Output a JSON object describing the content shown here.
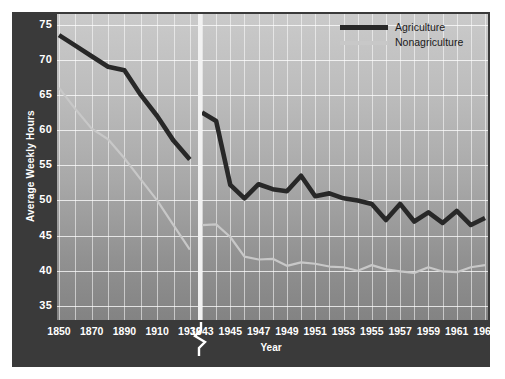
{
  "chart_data": {
    "type": "line",
    "title": "",
    "xlabel": "Year",
    "ylabel": "Average Weekly Hours",
    "ylim": [
      33,
      76.5
    ],
    "yticks": [
      35,
      40,
      45,
      50,
      55,
      60,
      65,
      70,
      75
    ],
    "grid": true,
    "axis_break": true,
    "legend_position": "top-right",
    "panels": [
      {
        "name": "historical",
        "xlim": [
          1850,
          1935
        ],
        "xticks": [
          1850,
          1870,
          1890,
          1910,
          1930
        ],
        "x": [
          1850,
          1860,
          1870,
          1880,
          1890,
          1900,
          1910,
          1920,
          1930
        ],
        "series": [
          {
            "name": "Agriculture",
            "color": "#282828",
            "values": [
              73.5,
              72.0,
              70.5,
              69.0,
              68.5,
              65.0,
              62.0,
              58.5,
              55.8
            ]
          },
          {
            "name": "Nonagriculture",
            "color": "#c8c8c8",
            "values": [
              66.0,
              63.0,
              60.2,
              58.7,
              56.0,
              53.0,
              50.0,
              46.5,
              43.0
            ]
          }
        ]
      },
      {
        "name": "modern",
        "xlim": [
          1943,
          1963
        ],
        "xticks": [
          1943,
          1945,
          1947,
          1949,
          1951,
          1953,
          1955,
          1957,
          1959,
          1961,
          1963
        ],
        "x": [
          1943,
          1944,
          1945,
          1946,
          1947,
          1948,
          1949,
          1950,
          1951,
          1952,
          1953,
          1954,
          1955,
          1956,
          1957,
          1958,
          1959,
          1960,
          1961,
          1962,
          1963
        ],
        "series": [
          {
            "name": "Agriculture",
            "color": "#282828",
            "values": [
              62.5,
              61.3,
              52.2,
              50.3,
              52.3,
              51.6,
              51.3,
              53.5,
              50.6,
              51.0,
              50.3,
              50.0,
              49.5,
              47.2,
              49.5,
              47.0,
              48.3,
              46.8,
              48.5,
              46.5,
              47.5
            ]
          },
          {
            "name": "Nonagriculture",
            "color": "#c8c8c8",
            "values": [
              46.5,
              46.6,
              44.8,
              42.0,
              41.6,
              41.7,
              40.7,
              41.2,
              41.0,
              40.6,
              40.5,
              40.0,
              40.8,
              40.2,
              39.9,
              39.7,
              40.5,
              39.9,
              39.8,
              40.5,
              40.8
            ]
          }
        ]
      }
    ],
    "legend": [
      {
        "label": "Agriculture",
        "color": "#282828"
      },
      {
        "label": "Nonagriculture",
        "color": "#c8c8c8"
      }
    ]
  },
  "axes": {
    "y_label": "Average Weekly Hours",
    "x_label": "Year"
  },
  "colors": {
    "frame": "#3a3a3a",
    "agriculture": "#282828",
    "nonagriculture": "#c8c8c8",
    "grid": "#ffffff",
    "tick_text": "#ffffff"
  }
}
